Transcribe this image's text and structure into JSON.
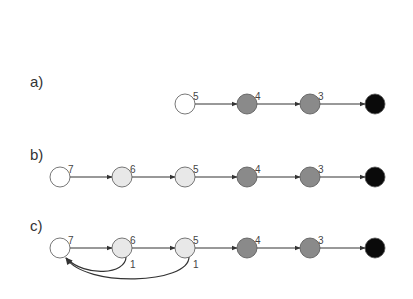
{
  "colors": {
    "white": "#ffffff",
    "light": "#e8e8e8",
    "mid": "#8a8a8a",
    "black": "#0a0a0a",
    "stroke": "#555555",
    "edge": "#333333"
  },
  "panels": [
    {
      "label": "a)",
      "y": 104,
      "nodes": [
        {
          "x": 185,
          "fill": "white",
          "num": "5"
        },
        {
          "x": 247,
          "fill": "mid",
          "num": "4"
        },
        {
          "x": 310,
          "fill": "mid",
          "num": "3"
        },
        {
          "x": 375,
          "fill": "black",
          "num": ""
        }
      ],
      "back_edges": []
    },
    {
      "label": "b)",
      "y": 177,
      "nodes": [
        {
          "x": 60,
          "fill": "white",
          "num": "7"
        },
        {
          "x": 122,
          "fill": "light",
          "num": "6"
        },
        {
          "x": 185,
          "fill": "light",
          "num": "5"
        },
        {
          "x": 247,
          "fill": "mid",
          "num": "4"
        },
        {
          "x": 310,
          "fill": "mid",
          "num": "3"
        },
        {
          "x": 375,
          "fill": "black",
          "num": ""
        }
      ],
      "back_edges": []
    },
    {
      "label": "c)",
      "y": 248,
      "nodes": [
        {
          "x": 60,
          "fill": "white",
          "num": "7"
        },
        {
          "x": 122,
          "fill": "light",
          "num": "6"
        },
        {
          "x": 185,
          "fill": "light",
          "num": "5"
        },
        {
          "x": 247,
          "fill": "mid",
          "num": "4"
        },
        {
          "x": 310,
          "fill": "mid",
          "num": "3"
        },
        {
          "x": 375,
          "fill": "black",
          "num": ""
        }
      ],
      "back_edges": [
        {
          "from": 1,
          "to": 0,
          "label": "1",
          "depth": 26
        },
        {
          "from": 2,
          "to": 0,
          "label": "1",
          "depth": 36
        }
      ]
    }
  ]
}
